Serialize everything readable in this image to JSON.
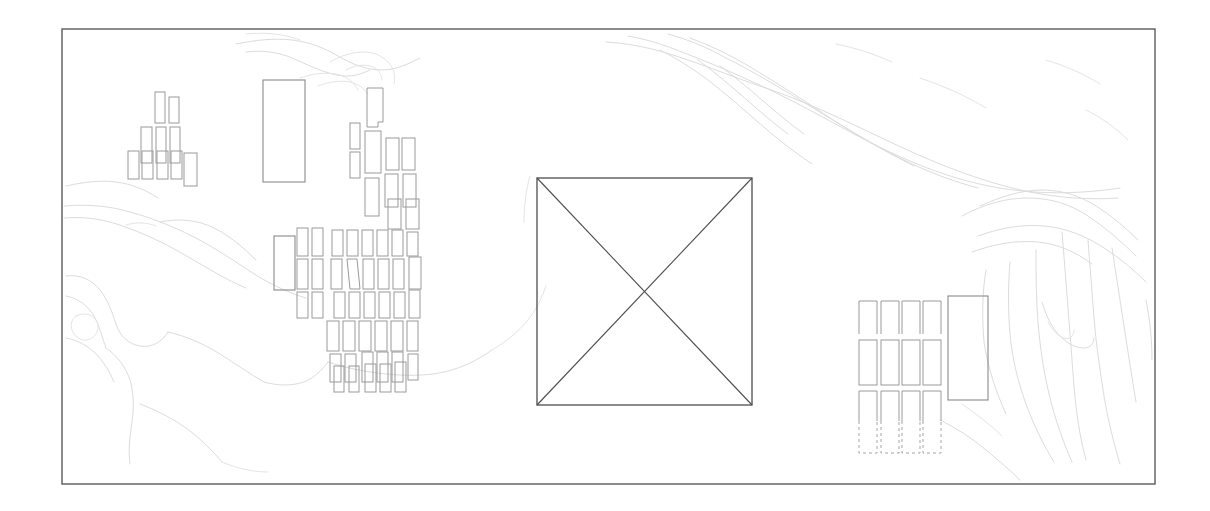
{
  "document": {
    "title": "Site Plan Drawing",
    "type": "architectural-site-plan",
    "description": "Monochrome line-drawing site plan: rectangular map frame containing faint topographic contour lines, several clusters of small rectangular building footprints, and a large square plot marked with an X.",
    "canvas": {
      "width": 1210,
      "height": 511,
      "background": "#ffffff"
    }
  },
  "colors": {
    "background": "#ffffff",
    "frame_stroke": "#5a5a5a",
    "contour_stroke": "#dcdcdc",
    "contour_soft_stroke": "#e4e4e4",
    "building_stroke": "#9a9a9a",
    "building_major_stroke": "#8a8a8a",
    "plot_stroke": "#4e4e4e",
    "dashed_stroke": "#a5a5a5"
  },
  "frame": {
    "label": "map-border",
    "x": 62,
    "y": 29,
    "width": 1093,
    "height": 455,
    "stroke": "#5a5a5a",
    "stroke_width": 1.4
  },
  "central_plot": {
    "label": "central-square-plot",
    "x": 537,
    "y": 178,
    "width": 215,
    "height": 227,
    "stroke": "#4e4e4e",
    "diagonals": true,
    "diagonal_count": 2,
    "note": "Large square outline crossed by both diagonals forming an X"
  },
  "clusters": [
    {
      "name": "northwest-pyramid-cluster",
      "label": "NW stepped building group",
      "count": 9,
      "bounds": {
        "x": 128,
        "y": 92,
        "width": 70,
        "height": 87
      },
      "buildings": [
        {
          "x": 155,
          "y": 92,
          "w": 10,
          "h": 31
        },
        {
          "x": 169,
          "y": 97,
          "w": 10,
          "h": 26
        },
        {
          "x": 141,
          "y": 127,
          "w": 11,
          "h": 36
        },
        {
          "x": 156,
          "y": 127,
          "w": 10,
          "h": 36
        },
        {
          "x": 170,
          "y": 127,
          "w": 10,
          "h": 36
        },
        {
          "x": 128,
          "y": 151,
          "w": 11,
          "h": 28
        },
        {
          "x": 142,
          "y": 151,
          "w": 11,
          "h": 28
        },
        {
          "x": 157,
          "y": 151,
          "w": 11,
          "h": 28
        },
        {
          "x": 171,
          "y": 151,
          "w": 11,
          "h": 28
        },
        {
          "x": 184,
          "y": 153,
          "w": 13,
          "h": 33
        }
      ]
    },
    {
      "name": "west-large-block",
      "label": "Large west rectangular block",
      "count": 1,
      "buildings": [
        {
          "x": 263,
          "y": 80,
          "w": 42,
          "h": 102
        }
      ]
    },
    {
      "name": "north-central-cluster",
      "label": "North-central building group",
      "count": 16,
      "bounds": {
        "x": 340,
        "y": 88,
        "width": 90,
        "height": 140
      },
      "buildings": [
        {
          "x": 367,
          "y": 88,
          "w": 16,
          "h": 38
        },
        {
          "x": 350,
          "y": 123,
          "w": 10,
          "h": 26
        },
        {
          "x": 350,
          "y": 152,
          "w": 10,
          "h": 26
        },
        {
          "x": 365,
          "y": 131,
          "w": 16,
          "h": 42
        },
        {
          "x": 386,
          "y": 138,
          "w": 13,
          "h": 32
        },
        {
          "x": 402,
          "y": 138,
          "w": 13,
          "h": 32
        },
        {
          "x": 365,
          "y": 178,
          "w": 14,
          "h": 38
        },
        {
          "x": 385,
          "y": 174,
          "w": 13,
          "h": 33
        },
        {
          "x": 403,
          "y": 174,
          "w": 13,
          "h": 33
        },
        {
          "x": 385,
          "y": 200,
          "w": 13,
          "h": 28
        },
        {
          "x": 403,
          "y": 200,
          "w": 13,
          "h": 28
        }
      ]
    },
    {
      "name": "west-mid-block",
      "label": "Medium block west of main grid",
      "count": 1,
      "buildings": [
        {
          "x": 274,
          "y": 236,
          "w": 21,
          "h": 54
        }
      ]
    },
    {
      "name": "main-grid-cluster",
      "label": "Main dense building grid",
      "rows": 7,
      "approx_count": 45,
      "bounds": {
        "x": 296,
        "y": 228,
        "width": 125,
        "height": 160
      },
      "rows_data": [
        {
          "row": 1,
          "y": 228,
          "h": 26,
          "cells": [
            296,
            311,
            331,
            346,
            361,
            376,
            391,
            406
          ]
        },
        {
          "row": 2,
          "y": 256,
          "h": 28,
          "cells": [
            296,
            311,
            331,
            346,
            361,
            376,
            391,
            408
          ]
        },
        {
          "row": 3,
          "y": 286,
          "h": 25,
          "cells": [
            296,
            311,
            333,
            348,
            363,
            378,
            393,
            406
          ]
        },
        {
          "row": 4,
          "y": 313,
          "h": 28,
          "cells": [
            326,
            341,
            356,
            371,
            386,
            401
          ]
        },
        {
          "row": 5,
          "y": 343,
          "h": 26,
          "cells": [
            326,
            341,
            356,
            371,
            386,
            403
          ]
        },
        {
          "row": 6,
          "y": 363,
          "h": 26,
          "cells": [
            331,
            346,
            361,
            376,
            391
          ]
        }
      ]
    },
    {
      "name": "east-grid-cluster",
      "label": "East building grid with dashed extensions",
      "columns": 4,
      "rows": 3,
      "bounds": {
        "x": 858,
        "y": 300,
        "width": 84,
        "height": 155
      },
      "column_x": [
        858,
        880,
        900,
        921
      ],
      "cell_width": 18,
      "row_specs": [
        {
          "row": 1,
          "y": 300,
          "h": 34,
          "style": "open-bottom"
        },
        {
          "row": 2,
          "y": 340,
          "h": 45,
          "style": "solid"
        },
        {
          "row": 3,
          "y": 390,
          "h": 30,
          "style": "solid-top-dashed-bottom"
        }
      ],
      "dashed_extension": {
        "y": 420,
        "h": 33,
        "style": "dashed"
      }
    },
    {
      "name": "east-large-block",
      "label": "Large east rectangular block",
      "count": 1,
      "buildings": [
        {
          "x": 948,
          "y": 296,
          "w": 40,
          "h": 104
        }
      ]
    }
  ],
  "terrain": {
    "label": "topographic-contours",
    "style": "faint gray contour lines",
    "regions": [
      "northeast ridge band running from upper-center to right edge",
      "east slope with closely spaced parallel contours",
      "southwest basin with broad rounded contours",
      "west ridge crossing the left third"
    ],
    "line_count_approx": 28
  },
  "legend": {
    "present": false,
    "scale_bar": false,
    "north_arrow": false,
    "text_labels": []
  }
}
